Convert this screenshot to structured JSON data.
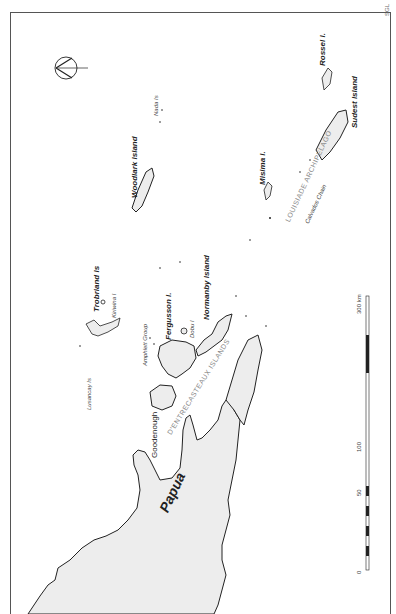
{
  "map": {
    "credit": "SGL",
    "region": "Papua",
    "labels": {
      "papua": "Papua",
      "woodlark": "Woodlark Island",
      "nada": "Nada Is",
      "rossel": "Rossel I.",
      "sudest": "Sudest Island",
      "misima": "Misima I.",
      "louisiade": "LOUISIADE  ARCHIPELAGO",
      "calvados": "Calvados Chain",
      "trobriand": "Trobriand Is",
      "kiriwina": "Kiriwina I",
      "lusancay": "Lusancay Is",
      "amphlett": "Amphlett Group",
      "fergusson": "Fergusson I.",
      "dobu": "Dobu I",
      "normanby": "Normanby Island",
      "goodenough": "Goodenough",
      "dentrecasteaux": "D'ENTRECASTEAUX  ISLANDS"
    },
    "scale_bar": {
      "unit": "km",
      "ticks": [
        "0",
        "50",
        "100",
        "300 km"
      ]
    },
    "north_arrow": "north-arrow"
  }
}
